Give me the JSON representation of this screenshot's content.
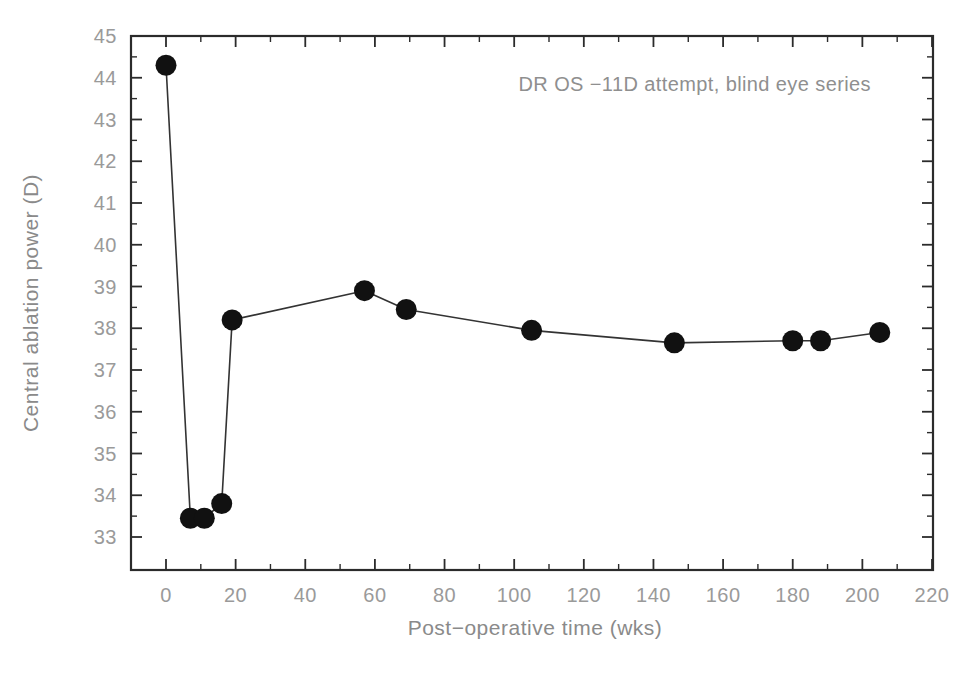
{
  "chart_data": {
    "type": "line",
    "title": "",
    "subtitle": "",
    "annotation": "DR OS −11D attempt, blind eye series",
    "xlabel": "Post−operative time (wks)",
    "ylabel": "Central ablation power (D)",
    "xlim": [
      -5,
      225
    ],
    "ylim": [
      33,
      45
    ],
    "xticks": [
      0,
      20,
      40,
      60,
      80,
      100,
      120,
      140,
      160,
      180,
      200,
      220
    ],
    "xtick_labels": [
      "0",
      "20",
      "40",
      "60",
      "80",
      "100",
      "120",
      "140",
      "160",
      "180",
      "200",
      "220"
    ],
    "yticks": [
      33,
      34,
      35,
      36,
      37,
      38,
      39,
      40,
      41,
      42,
      43,
      44,
      45
    ],
    "ytick_labels": [
      "33",
      "34",
      "35",
      "36",
      "37",
      "38",
      "39",
      "40",
      "41",
      "42",
      "43",
      "44",
      "45"
    ],
    "x_minor_step": 10,
    "y_minor_step": 0.5,
    "grid": false,
    "legend": false,
    "marker_style": "filled-circle",
    "marker_color": "#111111",
    "line_color": "#333333",
    "text_color": "#8f8f8f",
    "axis_color": "#2b2b2b",
    "background": "#ffffff",
    "x": [
      0,
      7,
      11,
      16,
      19,
      57,
      69,
      105,
      146,
      180,
      188,
      205
    ],
    "y": [
      44.3,
      33.45,
      33.45,
      33.8,
      38.2,
      38.9,
      38.45,
      37.95,
      37.65,
      37.7,
      37.7,
      37.9
    ],
    "series": [
      {
        "name": "DR OS blind eye series",
        "points": [
          {
            "x": 0,
            "y": 44.3
          },
          {
            "x": 7,
            "y": 33.45
          },
          {
            "x": 11,
            "y": 33.45
          },
          {
            "x": 16,
            "y": 33.8
          },
          {
            "x": 19,
            "y": 38.2
          },
          {
            "x": 57,
            "y": 38.9
          },
          {
            "x": 69,
            "y": 38.45
          },
          {
            "x": 105,
            "y": 37.95
          },
          {
            "x": 146,
            "y": 37.65
          },
          {
            "x": 180,
            "y": 37.7
          },
          {
            "x": 188,
            "y": 37.7
          },
          {
            "x": 205,
            "y": 37.9
          }
        ]
      }
    ]
  }
}
